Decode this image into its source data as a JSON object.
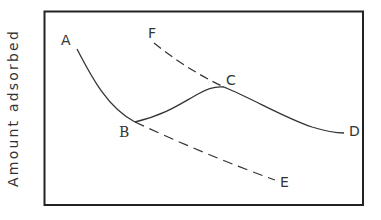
{
  "diagram": {
    "y_axis_label": "Amount adsorbed",
    "x_axis_label": "",
    "points": {
      "A": "A",
      "B": "B",
      "C": "C",
      "D": "D",
      "E": "E",
      "F": "F"
    },
    "curves": [
      {
        "name": "A-B",
        "style": "solid"
      },
      {
        "name": "B-C",
        "style": "solid"
      },
      {
        "name": "C-D",
        "style": "solid"
      },
      {
        "name": "F-C",
        "style": "dashed"
      },
      {
        "name": "B-E",
        "style": "dashed"
      }
    ],
    "colors": {
      "line": "#333333",
      "frame": "#222222",
      "background": "#ffffff"
    }
  }
}
